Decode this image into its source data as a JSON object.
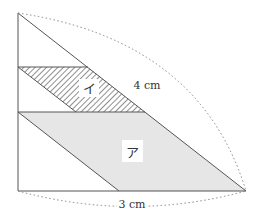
{
  "diagram": {
    "type": "geometry",
    "labels": {
      "hypotenuse_length": "4 cm",
      "base_length": "3 cm",
      "region_a": "ア",
      "region_i": "イ"
    },
    "colors": {
      "outline": "#555555",
      "gray_fill": "#e6e6e6",
      "hatch": "#444444",
      "dotted": "#888888"
    },
    "points": {
      "top_vertex": [
        18,
        13
      ],
      "bottom_left": [
        18,
        191
      ],
      "bottom_right": [
        246,
        191
      ],
      "hatch_top_left": [
        18,
        67
      ],
      "hatch_top_right": [
        88,
        67
      ],
      "hatch_bottom_right": [
        145,
        112
      ],
      "hatch_bottom_left": [
        76,
        112
      ],
      "gray_top_left": [
        18,
        112
      ],
      "gray_top_right": [
        145,
        112
      ],
      "gray_bottom_left": [
        119,
        191
      ]
    }
  }
}
